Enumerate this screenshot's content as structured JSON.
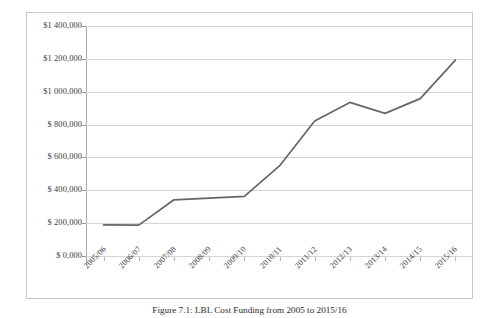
{
  "figure": {
    "caption": "Figure 7.1: LBL Cost Funding from 2005 to 2015/16",
    "background_color": "#ffffff",
    "border_color": "#c8c8c8"
  },
  "chart_data": {
    "type": "line",
    "title": "",
    "subtitle": "",
    "xlabel": "",
    "ylabel": "",
    "categories": [
      "2005/06",
      "2006/07",
      "2007/08",
      "2008/09",
      "2009/10",
      "2010/11",
      "2011/12",
      "2012/13",
      "2013/14",
      "2014/15",
      "2015/16"
    ],
    "values": [
      190000,
      188000,
      342000,
      352000,
      363000,
      548000,
      822000,
      935000,
      868000,
      958000,
      1192000
    ],
    "series": [
      {
        "name": "LBL Cost Funding",
        "values": [
          190000,
          188000,
          342000,
          352000,
          363000,
          548000,
          822000,
          935000,
          868000,
          958000,
          1192000
        ],
        "color": "#666666"
      }
    ],
    "ylim": [
      0,
      1400000
    ],
    "ytick_values": [
      0,
      200000,
      400000,
      600000,
      800000,
      1000000,
      1200000,
      1400000
    ],
    "ytick_labels": [
      "$ 0,000",
      "$ 200,000",
      "$ 400,000",
      "$ 600,000",
      "$ 800,000",
      "$1 000,000",
      "$1 200,000",
      "$1 400,000"
    ],
    "grid": "horizontal",
    "gridline_color": "#d4d4d4",
    "legend": "none",
    "legend_position": "none",
    "line_color": "#666666",
    "line_width": 1.7,
    "markers": "none",
    "xtick_rotation": -45
  }
}
